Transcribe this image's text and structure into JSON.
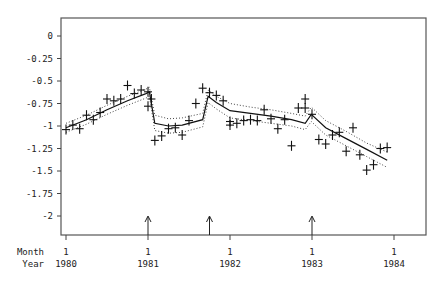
{
  "chart_data": {
    "type": "scatter",
    "title": "",
    "xlabel_rows": [
      "Month",
      "Year"
    ],
    "ylabel": "",
    "ylim": [
      -2.25,
      0.2
    ],
    "y_ticks": [
      0,
      -0.25,
      -0.5,
      -0.75,
      -1,
      -1.25,
      -1.5,
      -1.75,
      -2
    ],
    "y_tick_labels": [
      "0",
      "-0.25",
      "-0.5",
      "-0.75",
      "-1",
      "-1.25",
      "-1.5",
      "-1.75",
      "-2"
    ],
    "x_ticks": [
      {
        "month": "1",
        "year": "1980",
        "index": 0
      },
      {
        "month": "1",
        "year": "1981",
        "index": 12
      },
      {
        "month": "1",
        "year": "1982",
        "index": 24
      },
      {
        "month": "1",
        "year": "1983",
        "index": 36
      },
      {
        "month": "1",
        "year": "1984",
        "index": 48
      }
    ],
    "grid": false,
    "intervention_arrows": [
      12,
      21,
      36
    ],
    "series": [
      {
        "name": "observed",
        "style": "plus-markers",
        "x": [
          0,
          1,
          2,
          3,
          4,
          5,
          6,
          7,
          8,
          9,
          10,
          11,
          12,
          13,
          14,
          15,
          16,
          17,
          18,
          19,
          20,
          21,
          22,
          23,
          24,
          25,
          26,
          27,
          28,
          29,
          30,
          31,
          32,
          33,
          34,
          35,
          36,
          37,
          38,
          39,
          40,
          41,
          42,
          43,
          44,
          45,
          46,
          47
        ],
        "values": [
          -1.04,
          -0.99,
          -1.03,
          -0.88,
          -0.93,
          -0.85,
          -0.7,
          -0.72,
          -0.7,
          -0.55,
          -0.64,
          -0.6,
          -0.78,
          -1.16,
          -1.11,
          -1.03,
          -1.02,
          -1.1,
          -0.94,
          -0.75,
          -0.58,
          -0.63,
          -0.66,
          -0.72,
          -0.99,
          -0.97,
          -0.94,
          -0.93,
          -0.94,
          -0.82,
          -0.92,
          -1.03,
          -0.93,
          -1.22,
          -0.8,
          -0.7,
          -0.87,
          -1.15,
          -1.2,
          -1.1,
          -1.07,
          -1.28,
          -1.02,
          -1.32,
          -1.49,
          -1.43,
          -1.25,
          -1.24
        ],
        "extra_points": [
          [
            12,
            -0.62
          ],
          [
            12.5,
            -0.7
          ],
          [
            24,
            -0.95
          ],
          [
            35,
            -0.8
          ]
        ]
      },
      {
        "name": "fitted",
        "style": "solid-line",
        "x": [
          0,
          3,
          6,
          9,
          11.7,
          12.2,
          13,
          15,
          17,
          20,
          20.8,
          22,
          24,
          27,
          30,
          33,
          35,
          35.9,
          38,
          41,
          44,
          47
        ],
        "values": [
          -1.02,
          -0.93,
          -0.82,
          -0.72,
          -0.64,
          -0.62,
          -0.97,
          -1.0,
          -0.99,
          -0.93,
          -0.67,
          -0.74,
          -0.83,
          -0.86,
          -0.89,
          -0.93,
          -0.97,
          -0.87,
          -1.02,
          -1.14,
          -1.26,
          -1.38
        ]
      },
      {
        "name": "upper-band",
        "style": "dotted-line",
        "x": [
          0,
          3,
          6,
          9,
          11.7,
          12.2,
          13,
          15,
          17,
          20,
          20.8,
          22,
          24,
          27,
          30,
          33,
          35,
          35.9,
          38,
          41,
          44,
          47
        ],
        "values": [
          -0.97,
          -0.88,
          -0.77,
          -0.67,
          -0.59,
          -0.57,
          -0.88,
          -0.92,
          -0.91,
          -0.86,
          -0.6,
          -0.67,
          -0.75,
          -0.79,
          -0.82,
          -0.86,
          -0.89,
          -0.79,
          -0.94,
          -1.06,
          -1.19,
          -1.29
        ]
      },
      {
        "name": "lower-band",
        "style": "dotted-line",
        "x": [
          0,
          3,
          6,
          9,
          11.7,
          12.2,
          13,
          15,
          17,
          20,
          20.8,
          22,
          24,
          27,
          30,
          33,
          35,
          35.9,
          38,
          41,
          44,
          47
        ],
        "values": [
          -1.07,
          -0.98,
          -0.87,
          -0.77,
          -0.69,
          -0.67,
          -1.05,
          -1.08,
          -1.07,
          -1.01,
          -0.74,
          -0.81,
          -0.91,
          -0.94,
          -0.97,
          -1.0,
          -1.04,
          -0.95,
          -1.1,
          -1.22,
          -1.34,
          -1.46
        ]
      }
    ]
  }
}
